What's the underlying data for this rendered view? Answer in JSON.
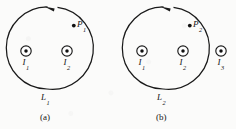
{
  "figure": {
    "background_color": "#fbfbfa",
    "ink_color": "#1a1a1a",
    "width": 236,
    "height": 129,
    "panels": [
      {
        "id": "a",
        "caption": "(a)",
        "loop": {
          "label": "L",
          "label_sub": "1",
          "center_x": 47,
          "center_y": 48,
          "radius": 41,
          "direction": "counterclockwise",
          "arrow_position": "top"
        },
        "field_point": {
          "label": "P",
          "label_sub": "1",
          "x": 76.5,
          "y": 25.5
        },
        "wires": [
          {
            "label": "I",
            "label_sub": "1",
            "x": 26,
            "y": 51,
            "direction": "out-of-page",
            "inside_loop": true
          },
          {
            "label": "I",
            "label_sub": "2",
            "x": 67,
            "y": 51,
            "direction": "out-of-page",
            "inside_loop": true
          }
        ]
      },
      {
        "id": "b",
        "caption": "(b)",
        "loop": {
          "label": "L",
          "label_sub": "2",
          "center_x": 163,
          "center_y": 48,
          "radius": 41,
          "direction": "counterclockwise",
          "arrow_position": "top"
        },
        "field_point": {
          "label": "P",
          "label_sub": "2",
          "x": 192.5,
          "y": 25.5
        },
        "wires": [
          {
            "label": "I",
            "label_sub": "1",
            "x": 142,
            "y": 51,
            "direction": "out-of-page",
            "inside_loop": true
          },
          {
            "label": "I",
            "label_sub": "2",
            "x": 183,
            "y": 51,
            "direction": "out-of-page",
            "inside_loop": true
          },
          {
            "label": "I",
            "label_sub": "3",
            "x": 221,
            "y": 51,
            "direction": "out-of-page",
            "inside_loop": false
          }
        ]
      }
    ]
  }
}
